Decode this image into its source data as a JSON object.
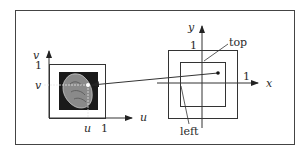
{
  "diagram": {
    "left_panel": {
      "axis_u_label": "u",
      "axis_v_label": "v",
      "tick_v_one": "1",
      "tick_v_value": "v",
      "tick_u_value": "u",
      "tick_u_one": "1",
      "texture_image": "textured-blob-image"
    },
    "right_panel": {
      "axis_x_label": "x",
      "axis_y_label": "y",
      "tick_y_one": "1",
      "tick_x_one": "1",
      "callout_top": "top",
      "callout_left": "left"
    },
    "colors": {
      "stroke": "#333333",
      "texture_bg": "#1a1a1a",
      "blob": "#9a9a9a"
    }
  }
}
